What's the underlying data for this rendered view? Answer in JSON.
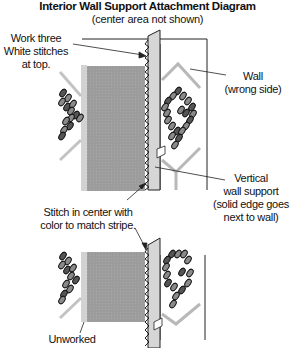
{
  "title": "Interior Wall Support Attachment Diagram",
  "subtitle": "(center area not shown)",
  "labels": {
    "work_three": "Work three\nWhite stitches\nat top.",
    "wall": "Wall\n(wrong side)",
    "vertical_support": "Vertical\nwall support\n(solid edge goes\nnext to wall)",
    "stitch_center": "Stitch in center with\ncolor to match stripe.",
    "unworked": "Unworked"
  },
  "icons": {
    "support_strip": "vertical-wall-support-strip",
    "wall_panel": "wall-panel-outline",
    "stitch_grid": "gray-stitched-canvas",
    "overcast": "overcast-zigzag-stitches",
    "heart_motif": "stitched-heart-motif",
    "chevrons": "gray-chevron-stripes"
  },
  "colors": {
    "canvas_fill": "#9a9a9a",
    "canvas_edge": "#cfcfcf",
    "support_fill": "#d4d4d4",
    "stitch_dark": "#555555",
    "stitch_mid": "#8a8a8a",
    "chevron": "#b5b5b5",
    "line": "#222222"
  }
}
